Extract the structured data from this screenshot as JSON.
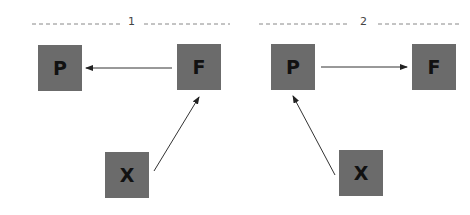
{
  "diagram": {
    "panels": [
      {
        "label": "1",
        "nodes": [
          {
            "id": "P",
            "label": "P",
            "x": 38,
            "y": 45
          },
          {
            "id": "F",
            "label": "F",
            "x": 177,
            "y": 44
          },
          {
            "id": "X",
            "label": "X",
            "x": 105,
            "y": 152
          }
        ],
        "edges": [
          {
            "from": "F",
            "to": "P"
          },
          {
            "from": "X",
            "to": "F"
          }
        ]
      },
      {
        "label": "2",
        "nodes": [
          {
            "id": "P",
            "label": "P",
            "x": 271,
            "y": 44
          },
          {
            "id": "F",
            "label": "F",
            "x": 412,
            "y": 44
          },
          {
            "id": "X",
            "label": "X",
            "x": 339,
            "y": 150
          }
        ],
        "edges": [
          {
            "from": "P",
            "to": "F"
          },
          {
            "from": "X",
            "to": "P"
          }
        ]
      }
    ],
    "colors": {
      "node_fill": "#6b6b6b",
      "node_text": "#111111",
      "edge": "#333333",
      "divider": "#888888"
    }
  }
}
